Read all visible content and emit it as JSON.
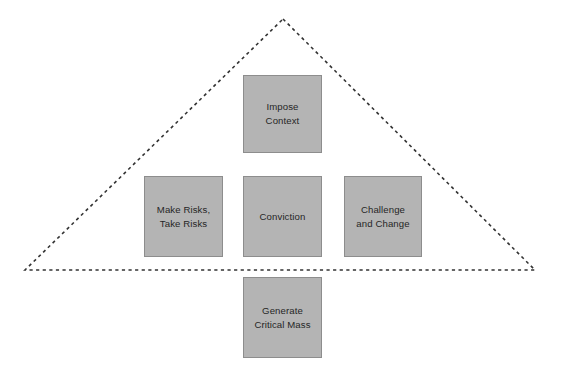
{
  "diagram": {
    "type": "pyramid-framework",
    "background_color": "#ffffff",
    "box_fill_color": "#b4b4b4",
    "box_border_color": "#8d8d8d",
    "text_color": "#262626",
    "outline_color": "#333333",
    "outline_style": "dashed",
    "triangle": {
      "apex_x": 283,
      "apex_y": 19,
      "bottom_left_x": 25,
      "bottom_left_y": 270,
      "bottom_right_x": 535,
      "bottom_right_y": 270
    },
    "boxes": [
      {
        "id": "impose-context",
        "label": "Impose\nContext",
        "line1": "Impose",
        "line2": "Context",
        "position": "apex",
        "inside_triangle": true
      },
      {
        "id": "make-risks-take-risks",
        "label": "Make Risks,\nTake Risks",
        "line1": "Make Risks,",
        "line2": "Take Risks",
        "position": "middle-left",
        "inside_triangle": true
      },
      {
        "id": "conviction",
        "label": "Conviction",
        "line1": "Conviction",
        "line2": "",
        "position": "middle-center",
        "inside_triangle": true
      },
      {
        "id": "challenge-and-change",
        "label": "Challenge\nand Change",
        "line1": "Challenge",
        "line2": "and Change",
        "position": "middle-right",
        "inside_triangle": true
      },
      {
        "id": "generate-critical-mass",
        "label": "Generate\nCritical Mass",
        "line1": "Generate",
        "line2": "Critical Mass",
        "position": "base-below",
        "inside_triangle": false
      }
    ]
  }
}
